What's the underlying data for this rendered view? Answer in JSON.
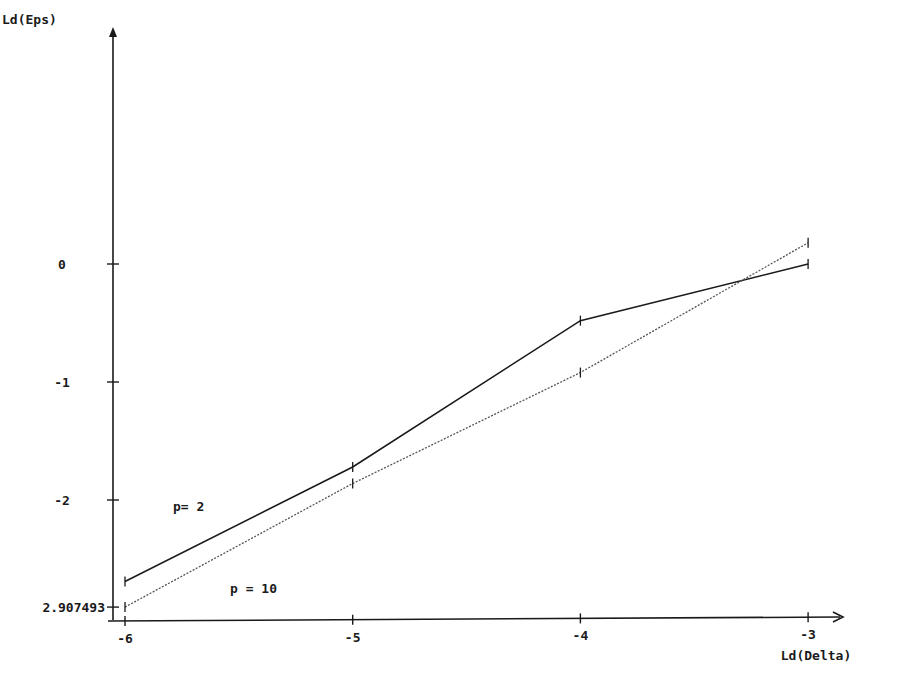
{
  "chart_data": {
    "type": "line",
    "title": "",
    "xlabel": "Ld(Delta)",
    "ylabel": "Ld(Eps)",
    "x": [
      -6,
      -5,
      -4,
      -3
    ],
    "x_ticks": [
      "-6",
      "-5",
      "-4",
      "-3"
    ],
    "y_ticks": [
      "0",
      "-1",
      "-2",
      "2.907493"
    ],
    "y_tick_values": [
      0,
      -1,
      -2,
      -2.907493
    ],
    "xlim": [
      -6,
      -3
    ],
    "ylim": [
      -2.907493,
      1.9
    ],
    "grid": false,
    "legend_position": "inline labels, lower left",
    "series": [
      {
        "name": "p= 2",
        "style": "solid",
        "values": [
          -2.69,
          -1.72,
          -0.48,
          0.0
        ]
      },
      {
        "name": "p = 10",
        "style": "dotted",
        "values": [
          -2.907493,
          -1.86,
          -0.92,
          0.18
        ]
      }
    ],
    "annotations": [
      "p= 2",
      "p = 10"
    ]
  },
  "colors": {
    "line": "#1a1a1a",
    "background": "#ffffff"
  }
}
